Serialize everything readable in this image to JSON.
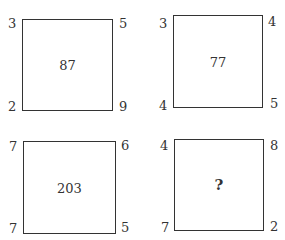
{
  "puzzle": {
    "boxes": [
      {
        "center": "87",
        "top_left": "3",
        "top_right": "5",
        "bottom_left": "2",
        "bottom_right": "9"
      },
      {
        "center": "77",
        "top_left": "3",
        "top_right": "4",
        "bottom_left": "4",
        "bottom_right": "5"
      },
      {
        "center": "203",
        "top_left": "7",
        "top_right": "6",
        "bottom_left": "7",
        "bottom_right": "5"
      },
      {
        "center": "?",
        "top_left": "4",
        "top_right": "8",
        "bottom_left": "7",
        "bottom_right": "2"
      }
    ]
  }
}
